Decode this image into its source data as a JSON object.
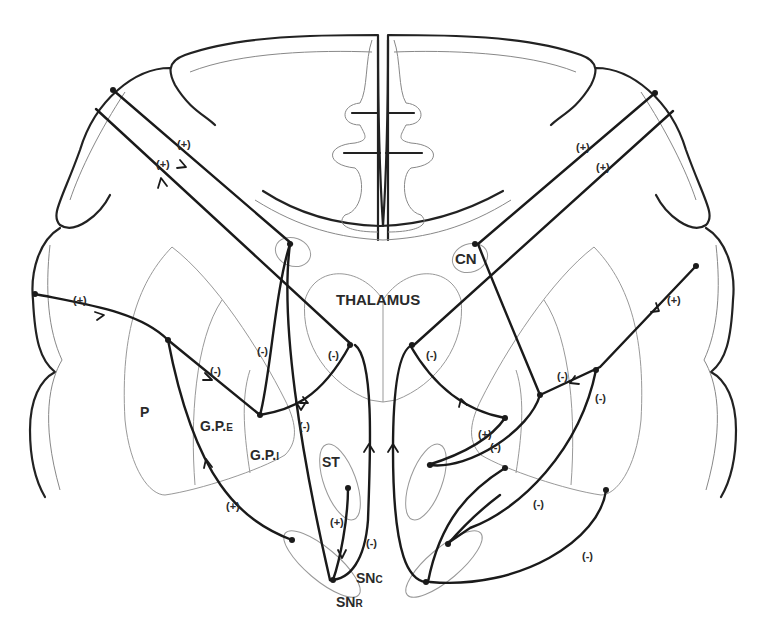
{
  "regions": {
    "thalamus": "THALAMUS",
    "caudate": "CN",
    "putamen": "P",
    "gpe": {
      "main": "G.P.",
      "sub": "E"
    },
    "gpi": {
      "main": "G.P.",
      "sub": "I"
    },
    "subthalamic": "ST",
    "snc": {
      "main": "SN",
      "sub": "C"
    },
    "snr": {
      "main": "SN",
      "sub": "R"
    }
  },
  "signs": {
    "cortex_left_1": "(+)",
    "cortex_left_2": "(+)",
    "cortex_right_1": "(+)",
    "cortex_right_2": "(+)",
    "cortex_to_putamen_left": "(+)",
    "cortex_to_putamen_right": "(+)",
    "putamen_to_gpe": "(-)",
    "caudate_to_gpe": "(-)",
    "gpe_to_thal_left": "(-)",
    "gpi_descend": "(-)",
    "thal_right": "(-)",
    "right_putamen_out": "(-)",
    "right_descend": "(-)",
    "right_st_plus": "(+)",
    "right_st_minus": "(-)",
    "right_lower_1": "(-)",
    "right_lower_2": "(-)",
    "snr_to_putamen": "(+)",
    "st_to_sn": "(+)",
    "sn_ascend": "(-)"
  },
  "legend_colors": {
    "pathway": "#1a1a1a",
    "region_outline": "#999999",
    "brain_outline": "#222222"
  }
}
